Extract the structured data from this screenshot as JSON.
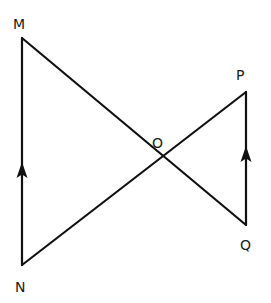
{
  "diagram": {
    "title": "",
    "points": {
      "M": {
        "label": "M",
        "x": 22,
        "y": 38,
        "label_x": 13,
        "label_y": 29
      },
      "N": {
        "label": "N",
        "x": 22,
        "y": 265,
        "label_x": 15,
        "label_y": 292
      },
      "P": {
        "label": "P",
        "x": 246,
        "y": 92,
        "label_x": 236,
        "label_y": 80
      },
      "Q": {
        "label": "Q",
        "x": 246,
        "y": 225,
        "label_x": 240,
        "label_y": 250
      },
      "O": {
        "label": "O",
        "x": 163,
        "y": 156,
        "label_x": 152,
        "label_y": 148
      }
    },
    "segments": [
      {
        "from": "M",
        "to": "Q"
      },
      {
        "from": "N",
        "to": "P"
      },
      {
        "from": "N",
        "to": "M",
        "arrow": "up"
      },
      {
        "from": "Q",
        "to": "P",
        "arrow": "up"
      }
    ],
    "arrows": {
      "MN": {
        "x": 22,
        "tip_y": 162,
        "description": "arrow pointing up, parallel mark"
      },
      "PQ": {
        "x": 246,
        "tip_y": 146,
        "description": "arrow pointing up, parallel mark"
      }
    },
    "line_color": "#111111"
  }
}
